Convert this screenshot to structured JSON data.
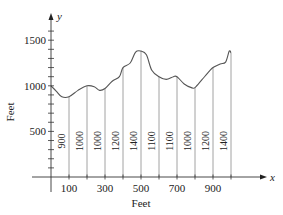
{
  "chart_data": {
    "type": "line",
    "title": "",
    "xlabel": "Feet",
    "ylabel": "Feet",
    "x_axis_var": "x",
    "y_axis_var": "y",
    "xlim": [
      0,
      1050
    ],
    "ylim": [
      0,
      1650
    ],
    "x_tick_labels": [
      "100",
      "300",
      "500",
      "700",
      "900"
    ],
    "x_tick_values": [
      100,
      200,
      300,
      400,
      500,
      600,
      700,
      800,
      900,
      1000
    ],
    "y_tick_labels": [
      "500",
      "1000",
      "1500"
    ],
    "y_minor_tick_step": 100,
    "grid": false,
    "legend": null,
    "vertical_lines": {
      "x": [
        100,
        200,
        300,
        400,
        500,
        600,
        700,
        800,
        900,
        1000
      ],
      "labels": [
        "900",
        "1000",
        "1000",
        "1200",
        "1400",
        "1100",
        "1100",
        "1000",
        "1200",
        "1400"
      ]
    },
    "curve": {
      "x": [
        0,
        30,
        60,
        100,
        150,
        200,
        240,
        270,
        300,
        340,
        380,
        400,
        440,
        470,
        500,
        530,
        560,
        600,
        640,
        680,
        700,
        740,
        780,
        800,
        840,
        880,
        900,
        940,
        970,
        990,
        1000
      ],
      "y": [
        1000,
        940,
        880,
        880,
        950,
        1000,
        990,
        950,
        970,
        1050,
        1100,
        1200,
        1250,
        1370,
        1380,
        1340,
        1170,
        1100,
        1070,
        1100,
        1100,
        1020,
        980,
        980,
        1070,
        1160,
        1200,
        1240,
        1260,
        1380,
        1360
      ]
    }
  }
}
